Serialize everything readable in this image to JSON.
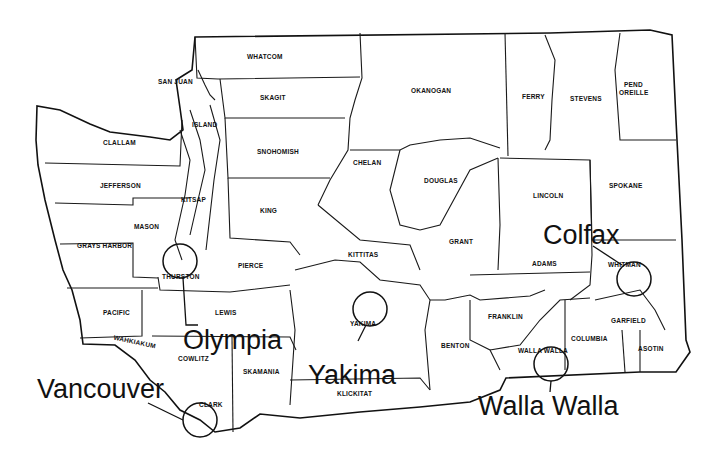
{
  "map": {
    "title": "Washington State Counties",
    "counties": [
      {
        "name": "WHATCOM",
        "x": 263,
        "y": 59
      },
      {
        "name": "SAN JUAN",
        "x": 175,
        "y": 84
      },
      {
        "name": "SKAGIT",
        "x": 268,
        "y": 100
      },
      {
        "name": "ISLAND",
        "x": 204,
        "y": 126
      },
      {
        "name": "CLALLAM",
        "x": 118,
        "y": 145
      },
      {
        "name": "SNOHOMISH",
        "x": 276,
        "y": 154
      },
      {
        "name": "JEFFERSON",
        "x": 119,
        "y": 187
      },
      {
        "name": "KITSAP",
        "x": 193,
        "y": 202
      },
      {
        "name": "KING",
        "x": 267,
        "y": 212
      },
      {
        "name": "MASON",
        "x": 150,
        "y": 229
      },
      {
        "name": "GRAYS HARBOR",
        "x": 104,
        "y": 247
      },
      {
        "name": "THURSTON",
        "x": 180,
        "y": 277
      },
      {
        "name": "PIERCE",
        "x": 250,
        "y": 267
      },
      {
        "name": "PACIFIC",
        "x": 115,
        "y": 314
      },
      {
        "name": "LEWIS",
        "x": 225,
        "y": 314
      },
      {
        "name": "WAHKIAKUM",
        "x": 130,
        "y": 342
      },
      {
        "name": "COWLITZ",
        "x": 193,
        "y": 360
      },
      {
        "name": "SKAMANIA",
        "x": 260,
        "y": 373
      },
      {
        "name": "CLARK",
        "x": 208,
        "y": 406
      },
      {
        "name": "OKANOGAN",
        "x": 431,
        "y": 92
      },
      {
        "name": "FERRY",
        "x": 533,
        "y": 98
      },
      {
        "name": "STEVENS",
        "x": 585,
        "y": 100
      },
      {
        "name": "PEND",
        "x": 633,
        "y": 86
      },
      {
        "name": "OREILLE",
        "x": 633,
        "y": 94
      },
      {
        "name": "CHELAN",
        "x": 368,
        "y": 164
      },
      {
        "name": "DOUGLAS",
        "x": 441,
        "y": 182
      },
      {
        "name": "LINCOLN",
        "x": 548,
        "y": 197
      },
      {
        "name": "SPOKANE",
        "x": 625,
        "y": 187
      },
      {
        "name": "KITTITAS",
        "x": 364,
        "y": 256
      },
      {
        "name": "GRANT",
        "x": 459,
        "y": 243
      },
      {
        "name": "ADAMS",
        "x": 542,
        "y": 265
      },
      {
        "name": "WHITMAN",
        "x": 622,
        "y": 266
      },
      {
        "name": "YAKIMA",
        "x": 362,
        "y": 325
      },
      {
        "name": "FRANKLIN",
        "x": 505,
        "y": 318
      },
      {
        "name": "BENTON",
        "x": 455,
        "y": 347
      },
      {
        "name": "WALLA WALLA",
        "x": 542,
        "y": 352
      },
      {
        "name": "COLUMBIA",
        "x": 590,
        "y": 340
      },
      {
        "name": "GARFIELD",
        "x": 631,
        "y": 322
      },
      {
        "name": "ASOTIN",
        "x": 653,
        "y": 350
      },
      {
        "name": "KLICKITAT",
        "x": 355,
        "y": 395
      }
    ],
    "cities": [
      {
        "name": "Olympia",
        "x": 183,
        "y": 349
      },
      {
        "name": "Yakima",
        "x": 308,
        "y": 384
      },
      {
        "name": "Vancouver",
        "x": 37,
        "y": 398
      },
      {
        "name": "Colfax",
        "x": 543,
        "y": 244
      },
      {
        "name": "Walla Walla",
        "x": 478,
        "y": 415
      }
    ]
  }
}
